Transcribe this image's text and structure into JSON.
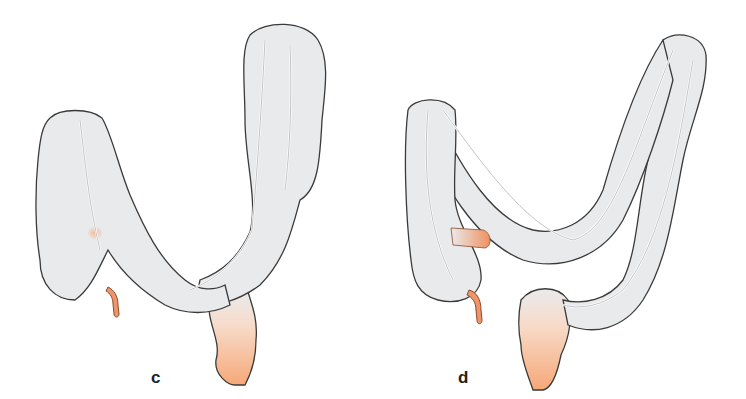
{
  "figure": {
    "panels": [
      {
        "id": "c",
        "label": "c",
        "description": "Colon variant with deep U-shaped transverse colon, cecum with appendix, sigmoid/rectum highlighted"
      },
      {
        "id": "d",
        "label": "d",
        "description": "Colon variant with elevated transverse loop and redundant sigmoid, terminal ileum and appendix highlighted"
      }
    ],
    "colors": {
      "colon_fill": "#e9eaec",
      "outline": "#3a3a3a",
      "vessel": "#ffffff",
      "highlight": "#f4a77a",
      "highlight_dark": "#e07a4a"
    }
  }
}
